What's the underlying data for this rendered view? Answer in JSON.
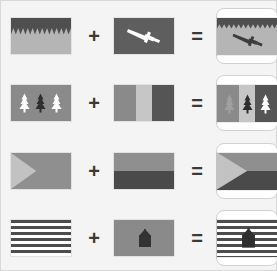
{
  "diagram": {
    "operators": {
      "plus": "+",
      "equals": "="
    },
    "background_color": "#f4f4f4",
    "border_color": "#d8d8d8",
    "palette": {
      "dark": "#4f4f4f",
      "mid_dark": "#5e5e5e",
      "mid": "#8a8a8a",
      "light": "#b9b9b9",
      "pale": "#cfcfcf",
      "white": "#ffffff",
      "card_border": "#d2d2d2"
    },
    "rows": [
      {
        "id": "row-1",
        "operand_a": {
          "name": "zigzag-band-flag",
          "description": "dark horizontal band with sawtooth lower edge over light gray field",
          "colors": [
            "#4f4f4f",
            "#b5b5b5"
          ]
        },
        "operand_b": {
          "name": "sword-flag",
          "description": "white diagonal sword on dark gray field",
          "colors": [
            "#5e5e5e",
            "#ffffff"
          ]
        },
        "result": {
          "name": "zigzag-band-sword-flag",
          "description": "sawtooth band flag charged with dark sword",
          "colors": [
            "#4f4f4f",
            "#b5b5b5",
            "#3d3d3d"
          ]
        }
      },
      {
        "id": "row-2",
        "operand_a": {
          "name": "three-trees-flag",
          "description": "three conifer trees, white dark white, on medium gray field",
          "colors": [
            "#8a8a8a",
            "#ffffff",
            "#3a3a3a"
          ]
        },
        "operand_b": {
          "name": "vertical-tricolor-flag",
          "description": "vertical bands medium gray, light gray, dark gray",
          "colors": [
            "#8a8a8a",
            "#c6c6c6",
            "#555555"
          ]
        },
        "result": {
          "name": "tricolor-three-trees-flag",
          "description": "vertical tricolor charged with three conifer trees",
          "colors": [
            "#8a8a8a",
            "#c6c6c6",
            "#555555",
            "#ffffff"
          ]
        }
      },
      {
        "id": "row-3",
        "operand_a": {
          "name": "chevron-flag",
          "description": "light gray triangle at hoist on medium gray field",
          "colors": [
            "#c2c2c2",
            "#8f8f8f"
          ]
        },
        "operand_b": {
          "name": "horizontal-bicolor-flag",
          "description": "medium gray over dark gray horizontal bands",
          "colors": [
            "#8f8f8f",
            "#4a4a4a"
          ]
        },
        "result": {
          "name": "bicolor-chevron-flag",
          "description": "horizontal bicolor with light triangle at hoist",
          "colors": [
            "#8f8f8f",
            "#4a4a4a",
            "#c2c2c2"
          ]
        }
      },
      {
        "id": "row-4",
        "operand_a": {
          "name": "horizontal-stripes-flag",
          "description": "alternating dark gray and white horizontal stripes",
          "colors": [
            "#4d4d4d",
            "#ffffff"
          ]
        },
        "operand_b": {
          "name": "house-flag",
          "description": "dark pentagon house emblem on medium gray field",
          "colors": [
            "#8a8a8a",
            "#333333"
          ]
        },
        "result": {
          "name": "striped-house-flag",
          "description": "striped flag charged with dark house emblem",
          "colors": [
            "#4d4d4d",
            "#ffffff",
            "#333333"
          ]
        }
      }
    ]
  }
}
